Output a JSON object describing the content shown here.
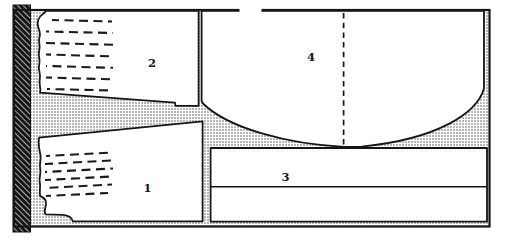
{
  "diagram": {
    "pieces": {
      "p1": {
        "label": "1"
      },
      "p2": {
        "label": "2"
      },
      "p3": {
        "label": "3"
      },
      "p4": {
        "label": "4"
      }
    },
    "textures": {
      "selvage_strip": "diagonal-hatch",
      "waste_background": "dot-stipple"
    },
    "colors": {
      "ink": "#161616",
      "paper": "#ffffff",
      "stipple_dot": "#4a4a4a",
      "hatch_fill": "#161616",
      "hatch_line": "#ffffff"
    }
  }
}
